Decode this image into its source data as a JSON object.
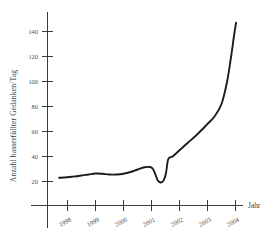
{
  "chart_data": {
    "type": "line",
    "title": "",
    "subtitle": "",
    "xlabel": "Jahr",
    "ylabel": "Anzahl hasserfüllter Gedanken/Tag",
    "xlim": [
      1997.4,
      2004.4
    ],
    "ylim": [
      0,
      152
    ],
    "grid": false,
    "legend": false,
    "legend_position": "none",
    "style": "hand-drawn",
    "x_tick_labels": [
      "1998",
      "1999",
      "2000",
      "2001",
      "2002",
      "2003",
      "2004"
    ],
    "x_tick_values": [
      1998,
      1999,
      2000,
      2001,
      2002,
      2003,
      2004
    ],
    "y_tick_labels": [
      "20",
      "40",
      "60",
      "80",
      "100",
      "120",
      "140"
    ],
    "y_tick_values": [
      20,
      40,
      60,
      80,
      100,
      120,
      140
    ],
    "series": [
      {
        "name": "Anzahl hasserfüllter Gedanken pro Tag",
        "color": "#1c1c1c",
        "x": [
          1997.7,
          1997.9,
          1998.15,
          1998.45,
          1998.75,
          1999.0,
          1999.25,
          1999.5,
          1999.75,
          2000.0,
          2000.25,
          2000.5,
          2000.75,
          2000.95,
          2001.05,
          2001.15,
          2001.22,
          2001.3,
          2001.38,
          2001.45,
          2001.52,
          2001.6,
          2001.75,
          2002.0,
          2002.3,
          2002.6,
          2003.0,
          2003.25,
          2003.5,
          2003.7,
          2003.85,
          2003.95,
          2004.02
        ],
        "y": [
          23.0,
          23.2,
          23.8,
          24.6,
          25.6,
          26.4,
          26.2,
          25.6,
          25.6,
          26.2,
          27.6,
          29.6,
          31.4,
          31.6,
          30.0,
          25.0,
          21.0,
          19.4,
          19.6,
          21.6,
          27.0,
          38.0,
          40.0,
          45.0,
          51.0,
          57.0,
          66.0,
          72.0,
          82.0,
          100.0,
          121.0,
          137.0,
          147.0
        ]
      }
    ],
    "annotations": []
  },
  "axes": {
    "y_axis_label": "Anzahl hasserfüllter Gedanken/Tag",
    "x_axis_label": "Jahr"
  }
}
